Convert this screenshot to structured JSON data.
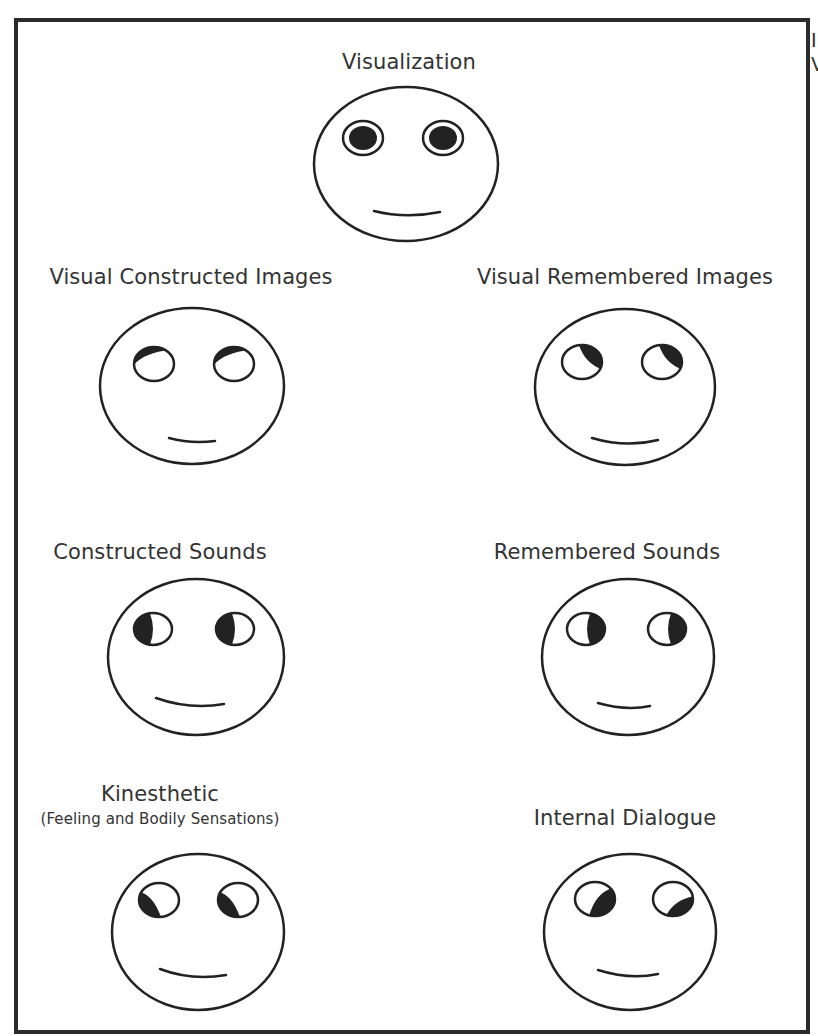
{
  "diagram": {
    "type": "eye-accessing-cues",
    "stroke_color": "#222222",
    "fill_color": "#222222",
    "frame_color": "#2b2b2b",
    "cutoff_text": [
      "I",
      "V"
    ],
    "faces": [
      {
        "id": "visualization",
        "label": "Visualization",
        "sublabel": "",
        "gaze": "center-defocused",
        "pupil_description": "large filled pupil centered with white ring"
      },
      {
        "id": "visual-constructed",
        "label": "Visual Constructed Images",
        "sublabel": "",
        "gaze": "up-left",
        "pupil_description": "dark crescent at upper-left of each eye"
      },
      {
        "id": "visual-remembered",
        "label": "Visual Remembered Images",
        "sublabel": "",
        "gaze": "up-right",
        "pupil_description": "dark crescent at upper-right of each eye"
      },
      {
        "id": "constructed-sounds",
        "label": "Constructed Sounds",
        "sublabel": "",
        "gaze": "left",
        "pupil_description": "dark half at left side of each eye"
      },
      {
        "id": "remembered-sounds",
        "label": "Remembered Sounds",
        "sublabel": "",
        "gaze": "right",
        "pupil_description": "dark half at right side of each eye"
      },
      {
        "id": "kinesthetic",
        "label": "Kinesthetic",
        "sublabel": "(Feeling and Bodily Sensations)",
        "gaze": "down-left",
        "pupil_description": "dark crescent at lower-left of each eye"
      },
      {
        "id": "internal-dialogue",
        "label": "Internal Dialogue",
        "sublabel": "",
        "gaze": "down-right",
        "pupil_description": "dark crescent at lower-right of each eye"
      }
    ]
  }
}
